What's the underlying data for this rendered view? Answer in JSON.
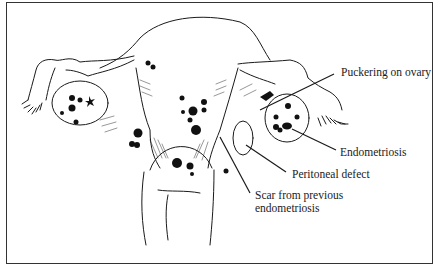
{
  "figure": {
    "labels": [
      {
        "id": "puckering",
        "text": "Puckering on ovary"
      },
      {
        "id": "endometriosis",
        "text": "Endometriosis"
      },
      {
        "id": "peritoneal",
        "text": "Peritoneal defect"
      },
      {
        "id": "scar",
        "lines": [
          "Scar from previous",
          "endometriosis"
        ]
      }
    ]
  },
  "colors": {
    "ink": "#1a1a1a",
    "border": "#333333",
    "background": "#ffffff"
  }
}
